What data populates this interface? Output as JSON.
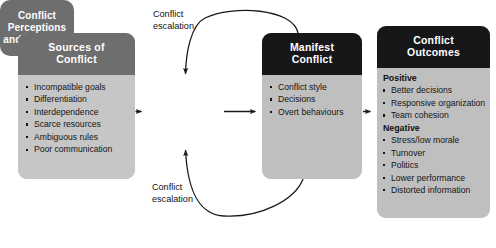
{
  "diagram": {
    "boxes": {
      "sources": {
        "header": "Sources of\nConflict",
        "items": [
          "Incompatible goals",
          "Differentiation",
          "Interdependence",
          "Scarce resources",
          "Ambiguous rules",
          "Poor communication"
        ]
      },
      "perceptions": {
        "label": "Conflict\nPerceptions\nand Emotions"
      },
      "manifest": {
        "header": "Manifest\nConflict",
        "items": [
          "Conflict style",
          "Decisions",
          "Overt behaviours"
        ]
      },
      "outcomes": {
        "header": "Conflict\nOutcomes",
        "groups": [
          {
            "label": "Positive",
            "items": [
              "Better decisions",
              "Responsive organization",
              "Team cohesion"
            ]
          },
          {
            "label": "Negative",
            "items": [
              "Stress/low morale",
              "Turnover",
              "Politics",
              "Lower performance",
              "Distorted information"
            ]
          }
        ]
      }
    },
    "captions": {
      "escalation_top": "Conflict\nescalation",
      "escalation_bottom": "Conflict\nescalation"
    },
    "colors": {
      "header_gray": "#6e6e6e",
      "header_black": "#17171a",
      "body_gray": "#c6c6c6",
      "center_gray": "#6e6e6e",
      "text_light": "#ffffff",
      "text_dark": "#141414",
      "arrow": "#1a1a1a",
      "background": "#ffffff"
    }
  }
}
